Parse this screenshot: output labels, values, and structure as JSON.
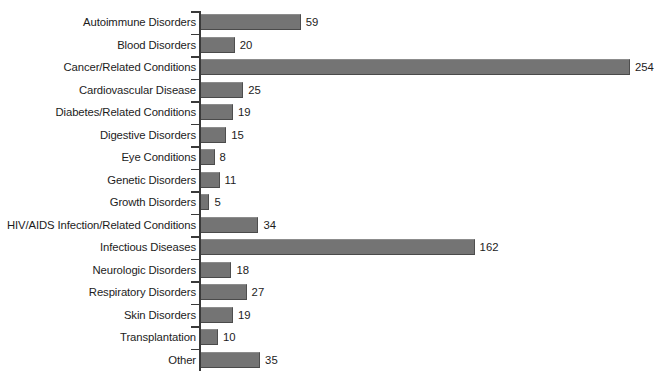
{
  "chart_data": {
    "type": "bar",
    "orientation": "horizontal",
    "title": "",
    "subtitle": "",
    "xlabel": "",
    "ylabel": "",
    "grid": false,
    "legend": null,
    "legend_position": "none",
    "xlim": [
      0,
      254
    ],
    "bar_color": "#747474",
    "axis_color": "#3a3a3a",
    "background": "#ffffff",
    "data_labels": true,
    "categories": [
      "Autoimmune Disorders",
      "Blood Disorders",
      "Cancer/Related Conditions",
      "Cardiovascular Disease",
      "Diabetes/Related Conditions",
      "Digestive Disorders",
      "Eye Conditions",
      "Genetic Disorders",
      "Growth Disorders",
      "HIV/AIDS Infection/Related Conditions",
      "Infectious Diseases",
      "Neurologic Disorders",
      "Respiratory Disorders",
      "Skin Disorders",
      "Transplantation",
      "Other"
    ],
    "values": [
      59,
      20,
      254,
      25,
      19,
      15,
      8,
      11,
      5,
      34,
      162,
      18,
      27,
      19,
      10,
      35
    ],
    "value_labels": [
      "59",
      "20",
      "254",
      "25",
      "19",
      "15",
      "8",
      "11",
      "5",
      "34",
      "162",
      "18",
      "27",
      "19",
      "10",
      "35"
    ]
  }
}
